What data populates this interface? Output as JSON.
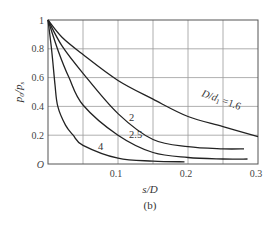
{
  "chart_data": {
    "type": "line",
    "title": "",
    "caption": "(b)",
    "xlabel": "s/D",
    "ylabel": "p0/ps",
    "xlim": [
      0,
      0.3
    ],
    "ylim": [
      0,
      1
    ],
    "xticks": [
      0.1,
      0.2,
      0.3
    ],
    "xtick_labels": [
      "0.1",
      "0.2",
      "0.3"
    ],
    "yticks": [
      0,
      0.2,
      0.4,
      0.6,
      0.8,
      1
    ],
    "ytick_labels": [
      "O",
      "0.2",
      "0.4",
      "0.6",
      "0.8",
      "1"
    ],
    "grid": true,
    "grid_x_step": 0.05,
    "grid_y_step": 0.2,
    "legend": "inline curve labels",
    "series": [
      {
        "name": "D/d1 = 1.6",
        "label": "1.6",
        "x": [
          0,
          0.02,
          0.05,
          0.1,
          0.15,
          0.2,
          0.25,
          0.3
        ],
        "y": [
          1,
          0.88,
          0.76,
          0.58,
          0.45,
          0.33,
          0.26,
          0.19
        ]
      },
      {
        "name": "D/d1 = 2",
        "label": "2",
        "x": [
          0,
          0.02,
          0.05,
          0.1,
          0.15,
          0.2,
          0.25,
          0.28
        ],
        "y": [
          1,
          0.82,
          0.63,
          0.35,
          0.17,
          0.12,
          0.105,
          0.105
        ]
      },
      {
        "name": "D/d1 = 2.5",
        "label": "2.5",
        "x": [
          0,
          0.015,
          0.03,
          0.05,
          0.1,
          0.15,
          0.2,
          0.25,
          0.285
        ],
        "y": [
          1,
          0.78,
          0.6,
          0.41,
          0.2,
          0.08,
          0.045,
          0.035,
          0.035
        ]
      },
      {
        "name": "D/d1 = 4",
        "label": "4",
        "x": [
          0,
          0.005,
          0.01,
          0.014,
          0.025,
          0.036,
          0.05,
          0.1,
          0.15,
          0.195
        ],
        "y": [
          1,
          0.8,
          0.55,
          0.4,
          0.27,
          0.2,
          0.13,
          0.04,
          0.02,
          0.015
        ]
      }
    ],
    "annotations": [
      {
        "text": "D/d1 = 1.6",
        "at": [
          0.22,
          0.5
        ]
      },
      {
        "text": "2",
        "at": [
          0.117,
          0.3
        ]
      },
      {
        "text": "2.5",
        "at": [
          0.12,
          0.15
        ]
      },
      {
        "text": "4",
        "at": [
          0.06,
          0.11
        ]
      }
    ]
  }
}
